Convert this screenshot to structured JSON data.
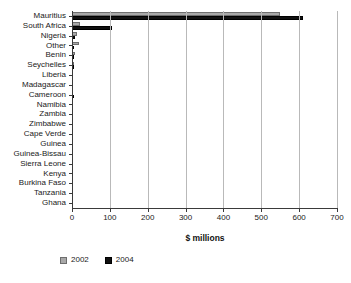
{
  "chart_data": {
    "type": "bar",
    "orientation": "horizontal",
    "title": "",
    "xlabel": "$ millions",
    "ylabel": "",
    "xlim": [
      0,
      700
    ],
    "xticks": [
      0,
      100,
      200,
      300,
      400,
      500,
      600,
      700
    ],
    "grid": true,
    "legend_position": "bottom-left",
    "categories": [
      "Mauritius",
      "South Africa",
      "Nigeria",
      "Other",
      "Benin",
      "Seychelles",
      "Liberia",
      "Madagascar",
      "Cameroon",
      "Namibia",
      "Zambia",
      "Zimbabwe",
      "Cape Verde",
      "Guinea",
      "Guinea-Bissau",
      "Sierra Leone",
      "Kenya",
      "Burkina Faso",
      "Tanzania",
      "Ghana"
    ],
    "series": [
      {
        "name": "2002",
        "color": "#a8a8a8",
        "values": [
          550,
          20,
          12,
          18,
          8,
          2,
          0,
          0,
          0,
          0,
          0,
          0,
          0,
          0,
          0,
          0,
          0,
          0,
          0,
          0
        ]
      },
      {
        "name": "2004",
        "color": "#101010",
        "values": [
          610,
          105,
          8,
          5,
          2,
          6,
          0,
          0,
          6,
          0,
          0,
          0,
          0,
          0,
          0,
          0,
          0,
          0,
          0,
          0
        ]
      }
    ]
  },
  "legend": {
    "items": [
      {
        "label": "2002",
        "swatch_class": "s2002"
      },
      {
        "label": "2004",
        "swatch_class": "s2004"
      }
    ]
  }
}
